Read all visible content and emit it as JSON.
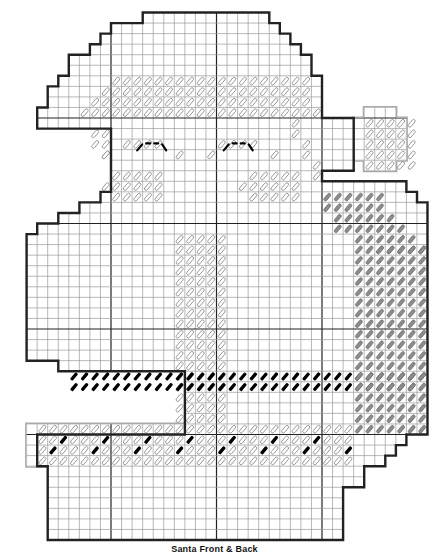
{
  "caption": "Santa Front & Back",
  "grid": {
    "cell": 10.55,
    "origin_x": 5.5,
    "origin_y": 12.5,
    "cols": 40,
    "rows": 50,
    "major_every": 10,
    "line_color": "#9a9a9a",
    "major_color": "#222222",
    "outline_color": "#222222",
    "panel_outline_color": "#aaaaaa"
  },
  "colors": {
    "white_stitch": "#ffffff",
    "white_stroke": "#888888",
    "gray_stitch": "#8c8c8c",
    "black_stitch": "#000000"
  },
  "outline_main": [
    [
      13,
      0
    ],
    [
      25,
      0
    ],
    [
      25,
      1
    ],
    [
      26,
      1
    ],
    [
      26,
      2
    ],
    [
      27,
      2
    ],
    [
      27,
      3
    ],
    [
      28,
      3
    ],
    [
      28,
      4
    ],
    [
      29,
      4
    ],
    [
      29,
      6
    ],
    [
      30,
      6
    ],
    [
      30,
      10
    ],
    [
      33,
      10
    ],
    [
      33,
      15
    ],
    [
      30,
      15
    ],
    [
      30,
      16
    ],
    [
      38,
      16
    ],
    [
      38,
      17
    ],
    [
      39,
      17
    ],
    [
      39,
      18
    ],
    [
      40,
      18
    ],
    [
      40,
      40
    ],
    [
      38,
      40
    ],
    [
      38,
      41
    ],
    [
      37,
      41
    ],
    [
      37,
      42
    ],
    [
      36,
      42
    ],
    [
      36,
      43
    ],
    [
      34,
      43
    ],
    [
      34,
      45
    ],
    [
      32,
      45
    ],
    [
      32,
      50
    ],
    [
      4,
      50
    ],
    [
      4,
      43
    ],
    [
      3,
      43
    ],
    [
      3,
      40
    ],
    [
      17,
      40
    ],
    [
      17,
      34
    ],
    [
      5,
      34
    ],
    [
      5,
      33
    ],
    [
      2,
      33
    ],
    [
      2,
      21
    ],
    [
      3,
      21
    ],
    [
      3,
      20
    ],
    [
      5,
      20
    ],
    [
      5,
      19
    ],
    [
      7,
      19
    ],
    [
      7,
      18
    ],
    [
      9,
      18
    ],
    [
      9,
      17
    ],
    [
      10,
      17
    ],
    [
      10,
      11
    ],
    [
      3,
      11
    ],
    [
      3,
      9
    ],
    [
      4,
      9
    ],
    [
      4,
      7
    ],
    [
      5,
      7
    ],
    [
      5,
      6
    ],
    [
      6,
      6
    ],
    [
      6,
      4
    ],
    [
      8,
      4
    ],
    [
      8,
      3
    ],
    [
      9,
      3
    ],
    [
      9,
      2
    ],
    [
      10,
      2
    ],
    [
      10,
      1
    ],
    [
      13,
      1
    ],
    [
      13,
      0
    ]
  ],
  "pompom": [
    [
      34,
      9
    ],
    [
      37,
      9
    ],
    [
      37,
      10
    ],
    [
      38,
      10
    ],
    [
      38,
      14
    ],
    [
      37,
      14
    ],
    [
      37,
      15
    ],
    [
      34,
      15
    ],
    [
      34,
      14
    ],
    [
      33,
      14
    ],
    [
      33,
      10
    ],
    [
      34,
      10
    ],
    [
      34,
      9
    ]
  ],
  "cuff_panel": [
    [
      2,
      39
    ],
    [
      33,
      39
    ],
    [
      33,
      42
    ],
    [
      32,
      42
    ],
    [
      32,
      43
    ],
    [
      2,
      43
    ],
    [
      2,
      39
    ]
  ],
  "stitch_regions": {
    "hat_brim_white": {
      "color": "white",
      "rows": [
        [
          6,
          10,
          28
        ],
        [
          7,
          9,
          28
        ],
        [
          8,
          8,
          28
        ],
        [
          9,
          7,
          29
        ]
      ]
    },
    "face_white": {
      "color": "white",
      "rows": [
        [
          11,
          8,
          9
        ],
        [
          12,
          8,
          9
        ],
        [
          13,
          9,
          10
        ]
      ]
    },
    "cheeks_white": [
      [
        15,
        10,
        14
      ],
      [
        16,
        9,
        14
      ],
      [
        17,
        10,
        14
      ],
      [
        15,
        23,
        27
      ],
      [
        16,
        22,
        27
      ],
      [
        17,
        23,
        27
      ]
    ],
    "nose_white": {
      "cols": [
        16,
        20
      ],
      "rows": [
        21,
        38
      ]
    },
    "beard_gray": {
      "rows": [
        [
          17,
          30,
          35
        ],
        [
          18,
          30,
          35
        ],
        [
          19,
          31,
          36
        ],
        [
          20,
          31,
          37
        ],
        [
          21,
          33,
          38
        ],
        [
          22,
          35,
          39
        ]
      ],
      "block": {
        "cols": [
          33,
          39
        ],
        "rows": [
          22,
          39
        ]
      }
    },
    "belt_black": {
      "rows": [
        [
          34,
          6,
          39
        ],
        [
          35,
          6,
          38
        ]
      ]
    },
    "cuff_white": {
      "cols": [
        3,
        32
      ],
      "rows": [
        39,
        42
      ]
    },
    "pompom_white": {
      "cols": [
        34,
        38
      ],
      "rows": [
        10,
        14
      ]
    }
  },
  "eyes": [
    {
      "cx": 14.0,
      "row": 12.5
    },
    {
      "cx": 22.2,
      "row": 12.5
    }
  ]
}
